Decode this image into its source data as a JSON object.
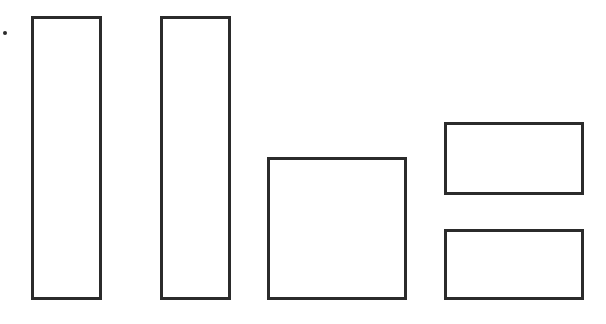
{
  "diagram": {
    "stroke_color": "#2b2b2b",
    "background": "#ffffff",
    "dot": {
      "x": 3,
      "y": 31,
      "size": 4
    },
    "shapes": [
      {
        "name": "tall-bar-left",
        "x": 31,
        "y": 16,
        "w": 71,
        "h": 284
      },
      {
        "name": "tall-bar-middle",
        "x": 160,
        "y": 16,
        "w": 71,
        "h": 284
      },
      {
        "name": "square-box",
        "x": 267,
        "y": 157,
        "w": 140,
        "h": 143
      },
      {
        "name": "rect-top-right",
        "x": 444,
        "y": 122,
        "w": 140,
        "h": 73
      },
      {
        "name": "rect-bottom-right",
        "x": 444,
        "y": 229,
        "w": 140,
        "h": 71
      }
    ]
  }
}
